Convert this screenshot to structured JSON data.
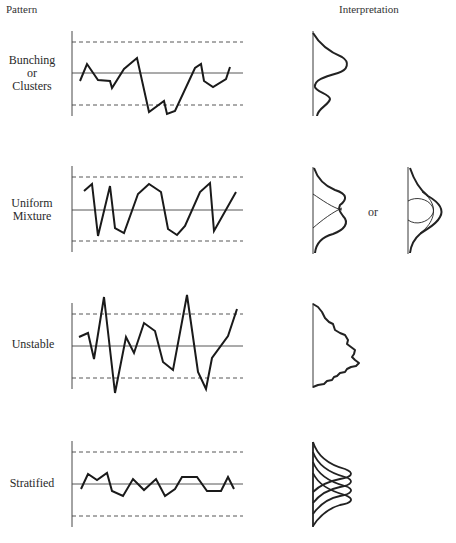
{
  "headers": {
    "pattern": "Pattern",
    "interpretation": "Interpretation"
  },
  "panels": [
    {
      "label_lines": [
        "Bunching",
        "or",
        "Clusters"
      ],
      "ucl_y": 42,
      "center_y": 73,
      "lcl_y": 105,
      "points": [
        [
          80,
          81
        ],
        [
          87,
          64
        ],
        [
          98,
          80
        ],
        [
          110,
          81
        ],
        [
          112,
          88
        ],
        [
          124,
          69
        ],
        [
          137,
          58
        ],
        [
          149,
          112
        ],
        [
          164,
          101
        ],
        [
          167,
          114
        ],
        [
          175,
          111
        ],
        [
          195,
          68
        ],
        [
          201,
          64
        ],
        [
          204,
          81
        ],
        [
          213,
          87
        ],
        [
          226,
          79
        ],
        [
          230,
          67
        ]
      ]
    },
    {
      "label_lines": [
        "Uniform",
        "Mixture"
      ],
      "ucl_y": 177,
      "center_y": 210,
      "lcl_y": 241,
      "points": [
        [
          84,
          191
        ],
        [
          92,
          184
        ],
        [
          98,
          236
        ],
        [
          110,
          186
        ],
        [
          115,
          228
        ],
        [
          124,
          233
        ],
        [
          138,
          194
        ],
        [
          149,
          184
        ],
        [
          161,
          192
        ],
        [
          168,
          229
        ],
        [
          177,
          235
        ],
        [
          185,
          226
        ],
        [
          200,
          192
        ],
        [
          210,
          183
        ],
        [
          214,
          231
        ],
        [
          236,
          192
        ]
      ],
      "or_text": "or"
    },
    {
      "label_lines": [
        "Unstable"
      ],
      "ucl_y": 314,
      "center_y": 346,
      "lcl_y": 378,
      "points": [
        [
          79,
          337
        ],
        [
          88,
          333
        ],
        [
          94,
          359
        ],
        [
          104,
          297
        ],
        [
          115,
          393
        ],
        [
          126,
          337
        ],
        [
          134,
          353
        ],
        [
          144,
          323
        ],
        [
          155,
          331
        ],
        [
          163,
          362
        ],
        [
          173,
          370
        ],
        [
          187,
          295
        ],
        [
          198,
          372
        ],
        [
          206,
          389
        ],
        [
          212,
          358
        ],
        [
          228,
          336
        ],
        [
          237,
          309
        ]
      ]
    },
    {
      "label_lines": [
        "Stratified"
      ],
      "ucl_y": 452,
      "center_y": 484,
      "lcl_y": 516,
      "points": [
        [
          81,
          489
        ],
        [
          88,
          474
        ],
        [
          97,
          480
        ],
        [
          107,
          473
        ],
        [
          112,
          491
        ],
        [
          123,
          496
        ],
        [
          133,
          479
        ],
        [
          144,
          490
        ],
        [
          156,
          479
        ],
        [
          165,
          496
        ],
        [
          175,
          489
        ],
        [
          182,
          477
        ],
        [
          197,
          477
        ],
        [
          207,
          491
        ],
        [
          221,
          491
        ],
        [
          228,
          477
        ],
        [
          234,
          489
        ]
      ]
    }
  ],
  "distributions": [
    "bimodal-unequal",
    "bimodal-overlapping OR two-overlapping-normals",
    "irregular-skewed",
    "stacked-narrow-normals"
  ]
}
